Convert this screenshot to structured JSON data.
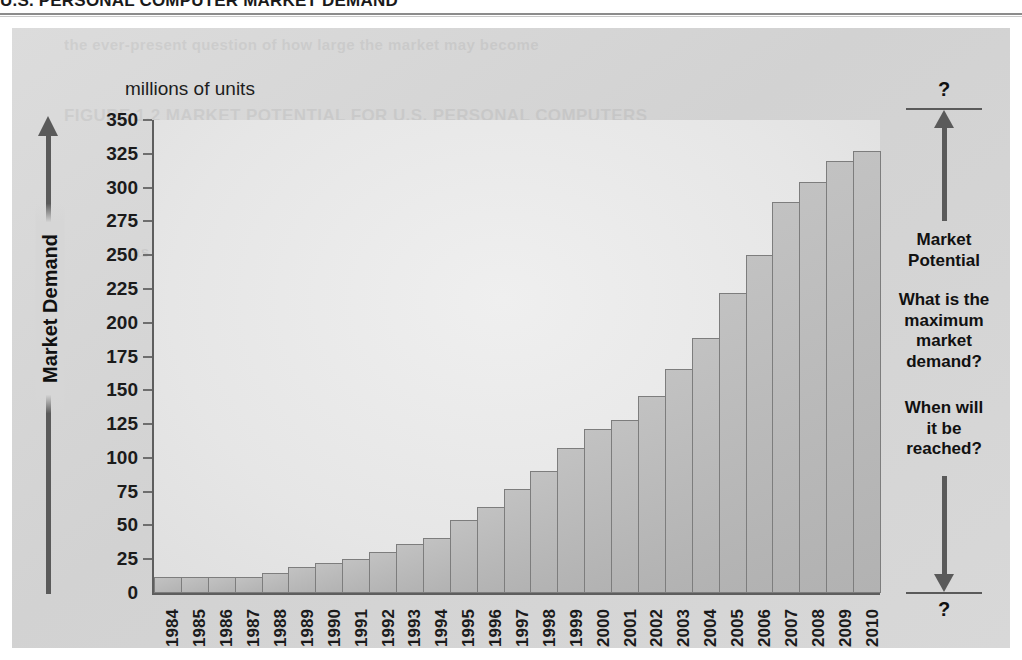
{
  "header": {
    "title": "U.S. PERSONAL COMPUTER MARKET DEMAND"
  },
  "ghost_text": {
    "line1": "the ever-present question of how large the market may become",
    "line2": "FIGURE 1.2   MARKET POTENTIAL FOR U.S. PERSONAL COMPUTERS",
    "line3": "as penetration of households continues to rise each year",
    "line4": "Source: Consumer Electronics Association"
  },
  "axis": {
    "units_caption": "millions of units",
    "y_axis_title": "Market Demand",
    "y_ticks": [
      "350",
      "325",
      "300",
      "275",
      "250",
      "225",
      "200",
      "175",
      "150",
      "125",
      "100",
      "75",
      "50",
      "25",
      "0"
    ]
  },
  "annotation": {
    "top_question": "?",
    "bottom_question": "?",
    "potential_label": "Market\nPotential",
    "potential_label_line1": "Market",
    "potential_label_line2": "Potential",
    "question_max": "What is the\nmaximum\nmarket\ndemand?",
    "question_when": "When will\nit be\nreached?"
  },
  "colors": {
    "panel_bg": "#d6d6d6",
    "plot_bg": "#e9e9e9",
    "bar_fill": "#b9b9b9",
    "bar_border": "#7d7d7d",
    "axis_line": "#5e5e5e",
    "arrow": "#5a5a5a",
    "text": "#111111"
  },
  "chart_data": {
    "type": "bar",
    "title": "U.S. PERSONAL COMPUTER MARKET DEMAND",
    "subtitle": "millions of units",
    "xlabel": "",
    "ylabel": "Market Demand",
    "ylim": [
      0,
      350
    ],
    "ytick_step": 25,
    "grid": false,
    "legend": "none",
    "categories": [
      "1984",
      "1985",
      "1986",
      "1987",
      "1988",
      "1989",
      "1990",
      "1991",
      "1992",
      "1993",
      "1994",
      "1995",
      "1996",
      "1997",
      "1998",
      "1999",
      "2000",
      "2001",
      "2002",
      "2003",
      "2004",
      "2005",
      "2006",
      "2007",
      "2008",
      "2009",
      "2010"
    ],
    "values": [
      12,
      12,
      12,
      12,
      15,
      19,
      22,
      25,
      30,
      36,
      41,
      54,
      64,
      77,
      90,
      107,
      121,
      128,
      146,
      166,
      189,
      222,
      250,
      289,
      304,
      320,
      327
    ],
    "annotations": [
      {
        "text": "Market Potential",
        "position": "right"
      },
      {
        "text": "What is the maximum market demand?",
        "position": "right"
      },
      {
        "text": "When will it be reached?",
        "position": "right"
      },
      {
        "text": "?",
        "position": "right-top"
      },
      {
        "text": "?",
        "position": "right-bottom"
      }
    ]
  }
}
